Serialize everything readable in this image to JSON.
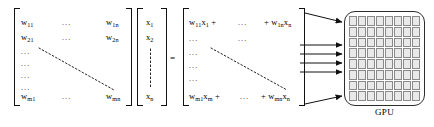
{
  "figure": {
    "type": "matrix-vector-multiplication-to-gpu-diagram",
    "equals_sign": "=",
    "gpu": {
      "label": "GPU",
      "grid_rows": 8,
      "grid_cols": 8,
      "cell_count": 64,
      "cell_fill": "#e9e9e9",
      "cell_border": "#8a8a8a",
      "block_border": "#2c2c2c"
    },
    "arrow_count": 6,
    "colors": {
      "ink": "#111111",
      "dots": "#222222",
      "background": "#ffffff"
    }
  },
  "weight_matrix": {
    "name": "W",
    "entries": {
      "top_left": "w",
      "top_left_sub": "11",
      "second_left": "w",
      "second_left_sub": "21",
      "bottom_left": "w",
      "bottom_left_sub": "m1",
      "top_right": "w",
      "top_right_sub": "1n",
      "second_right": "w",
      "second_right_sub": "2n",
      "bottom_right": "w",
      "bottom_right_sub": "mn"
    },
    "ellipsis_horizontal": "...",
    "ellipsis_vertical": "...",
    "row_ellipses": [
      "...",
      "...",
      "...",
      "..."
    ]
  },
  "input_vector": {
    "name": "x",
    "entries": {
      "first": "x",
      "first_sub": "1",
      "second": "x",
      "second_sub": "2",
      "last": "x",
      "last_sub": "n"
    },
    "vertical_dots": "⋮"
  },
  "result_vector": {
    "name": "Wx",
    "rows": [
      {
        "left_term": "w",
        "left_term_sub": "11",
        "left_var": "x",
        "left_var_sub": "1",
        "left_plus": "+",
        "middle_ellipsis": "...",
        "right_plus": "+",
        "right_term": "w",
        "right_term_sub": "1n",
        "right_var": "x",
        "right_var_sub": "n"
      },
      {
        "left_term": "w",
        "left_term_sub": "m1",
        "left_var": "x",
        "left_var_sub": "m",
        "left_plus": "+",
        "middle_ellipsis": "...",
        "right_plus": "+",
        "right_term": "w",
        "right_term_sub": "mn",
        "right_var": "x",
        "right_var_sub": "n"
      }
    ],
    "ellipsis_horizontal": "...",
    "row_ellipses": [
      "...",
      "...",
      "...",
      "..."
    ]
  }
}
